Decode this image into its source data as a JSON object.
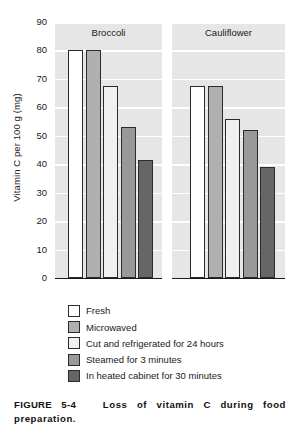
{
  "figure": {
    "caption_label": "FIGURE 5-4",
    "caption_text": "Loss of vitamin C during food preparation."
  },
  "chart_data": {
    "type": "bar",
    "title": "",
    "xlabel": "",
    "ylabel": "Vitamin C per 100 g (mg)",
    "ylim": [
      0,
      90
    ],
    "yticks": [
      0,
      10,
      20,
      30,
      40,
      50,
      60,
      70,
      80,
      90
    ],
    "ytick_labels": [
      "0",
      "10",
      "20",
      "30",
      "40",
      "50",
      "60",
      "70",
      "80",
      "90"
    ],
    "grid": true,
    "grid_axis": "y",
    "legend_position": "below-plot",
    "panels": [
      "Broccoli",
      "Cauliflower"
    ],
    "categories": [
      "Broccoli",
      "Cauliflower"
    ],
    "series": [
      {
        "name": "Fresh",
        "color": "#ffffff",
        "values": [
          80,
          67.5
        ]
      },
      {
        "name": "Microwaved",
        "color": "#b0b0b0",
        "values": [
          80,
          67.5
        ]
      },
      {
        "name": "Cut and refrigerated for 24 hours",
        "color": "#f0f0f0",
        "values": [
          67.5,
          56
        ]
      },
      {
        "name": "Steamed for 3 minutes",
        "color": "#999999",
        "values": [
          53,
          52
        ]
      },
      {
        "name": "In heated cabinet for 30 minutes",
        "color": "#666666",
        "values": [
          41.5,
          39
        ]
      }
    ]
  },
  "colors": {
    "panel_background": "#e6e6e6",
    "gridline": "#ffffff",
    "bar_outline": "#2b2b2b",
    "axis": "#1a1a1a",
    "text": "#1a1a1a"
  }
}
